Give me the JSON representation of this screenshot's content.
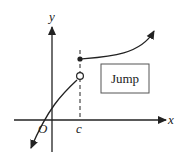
{
  "diagram": {
    "axes": {
      "x_label": "x",
      "y_label": "y",
      "origin_label": "O",
      "tick_label": "c"
    },
    "annotation": {
      "box_text": "Jump"
    },
    "points": {
      "filled_dot": "closed endpoint at x = c (upper branch)",
      "open_circle": "open endpoint at x = c (lower branch)"
    },
    "colors": {
      "stroke": "#222222",
      "background": "#ffffff"
    }
  }
}
